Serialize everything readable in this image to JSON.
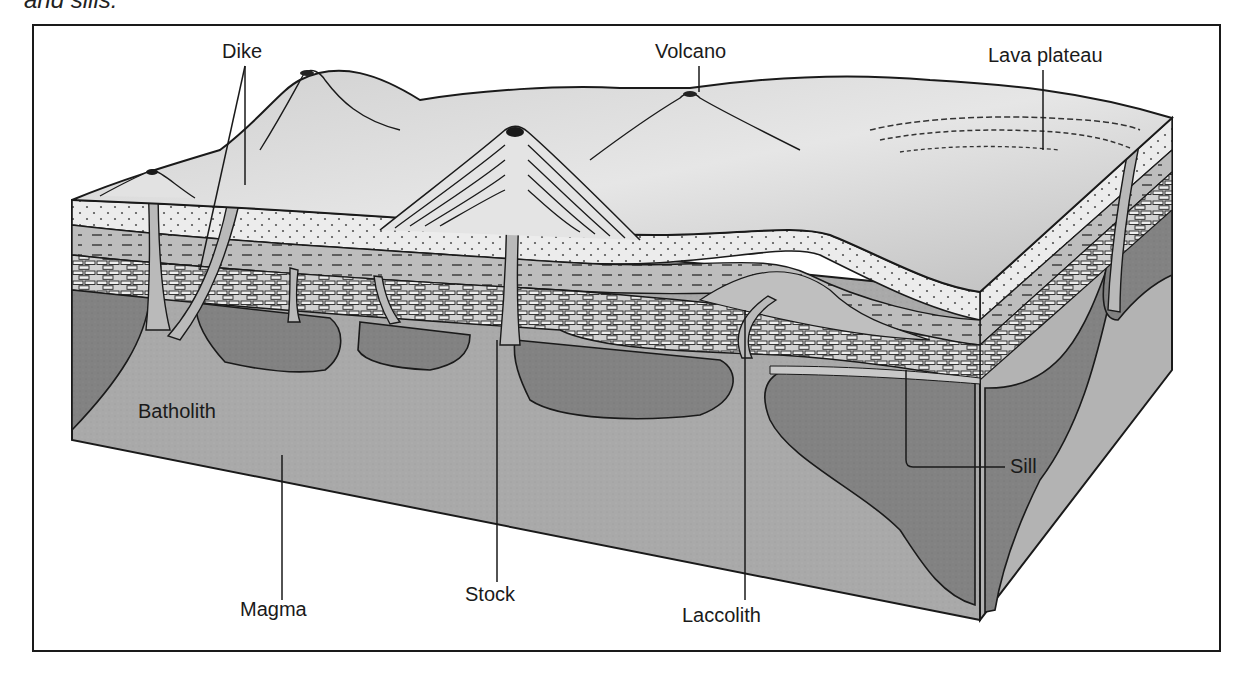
{
  "caption_fragment": "and sills.",
  "diagram": {
    "labels": {
      "dike": "Dike",
      "volcano": "Volcano",
      "lava_plateau": "Lava plateau",
      "batholith": "Batholith",
      "magma": "Magma",
      "stock": "Stock",
      "laccolith": "Laccolith",
      "sill": "Sill"
    },
    "colors": {
      "surface": "#d9d9d9",
      "sandstone": "#e8e8e8",
      "shale": "#b9b9b9",
      "limestone": "#d4d4d4",
      "magma": "#a8a8a8",
      "pluton": "#808080",
      "outline": "#1a1a1a"
    }
  }
}
